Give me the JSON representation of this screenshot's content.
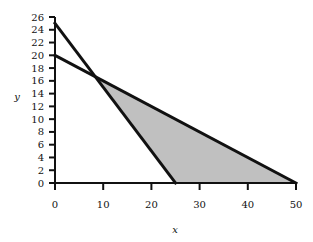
{
  "chart_data": {
    "type": "line",
    "title": "",
    "xlabel": "x",
    "ylabel": "y",
    "xlim": [
      0,
      50
    ],
    "ylim": [
      0,
      26
    ],
    "x_ticks": [
      0,
      10,
      20,
      30,
      40,
      50
    ],
    "y_ticks": [
      0,
      2,
      4,
      6,
      8,
      10,
      12,
      14,
      16,
      18,
      20,
      22,
      24,
      26
    ],
    "grid": false,
    "legend": null,
    "series": [
      {
        "name": "line-1",
        "x": [
          0,
          25
        ],
        "y": [
          25,
          0
        ],
        "color": "#111111"
      },
      {
        "name": "line-2",
        "x": [
          0,
          50
        ],
        "y": [
          20,
          0
        ],
        "color": "#111111"
      }
    ],
    "shaded_region": {
      "vertices": [
        [
          8.33,
          16.67
        ],
        [
          25,
          0
        ],
        [
          50,
          0
        ]
      ],
      "color": "#c0c0c0"
    },
    "intersection": [
      8.33,
      16.67
    ]
  },
  "labels": {
    "x_axis": "x",
    "y_axis": "y",
    "x_ticks": [
      "0",
      "10",
      "20",
      "30",
      "40",
      "50"
    ],
    "y_ticks": [
      "0",
      "2",
      "4",
      "6",
      "8",
      "10",
      "12",
      "14",
      "16",
      "18",
      "20",
      "22",
      "24",
      "26"
    ]
  }
}
